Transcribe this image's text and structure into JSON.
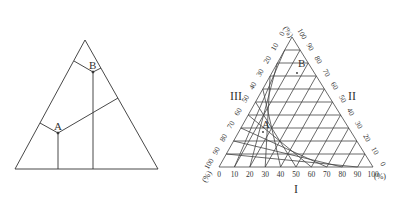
{
  "left_diagram": {
    "points": [
      {
        "label": "A"
      },
      {
        "label": "B"
      }
    ]
  },
  "right_diagram": {
    "axis_unit": "(%)",
    "region_labels": {
      "bottom": "I",
      "right": "II",
      "left": "III"
    },
    "bottom_ticks": [
      "0",
      "10",
      "20",
      "30",
      "40",
      "50",
      "60",
      "70",
      "80",
      "90",
      "100"
    ],
    "right_ticks": [
      "100",
      "90",
      "80",
      "70",
      "60",
      "50",
      "40",
      "30",
      "20",
      "10",
      "0"
    ],
    "left_ticks": [
      "0",
      "10",
      "20",
      "30",
      "40",
      "50",
      "60",
      "70",
      "80",
      "90",
      "100"
    ],
    "points": [
      {
        "label": "A"
      },
      {
        "label": "B"
      }
    ]
  },
  "colors": {
    "line": "#333333",
    "grid": "#444444",
    "text": "#333333"
  }
}
